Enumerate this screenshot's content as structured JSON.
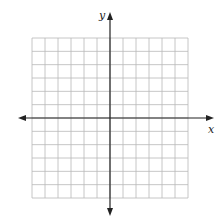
{
  "diagram": {
    "type": "coordinate-plane",
    "grid": {
      "columns": 12,
      "rows": 12,
      "left": 32,
      "top": 38,
      "right": 188,
      "bottom": 198,
      "color": "#b8b8b8"
    },
    "origin": {
      "x": 110,
      "y": 118
    },
    "x_axis": {
      "label": "x",
      "from": 18,
      "to": 214,
      "color": "#222222"
    },
    "y_axis": {
      "label": "y",
      "from": 12,
      "to": 216,
      "color": "#222222"
    }
  }
}
